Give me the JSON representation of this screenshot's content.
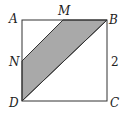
{
  "diagram": {
    "type": "geometry",
    "shape": "square ABCD with shaded quadrilateral MBDN",
    "points": {
      "A": {
        "label": "A",
        "x": 22,
        "y": 20
      },
      "B": {
        "label": "B",
        "x": 107,
        "y": 20
      },
      "C": {
        "label": "C",
        "x": 107,
        "y": 101
      },
      "D": {
        "label": "D",
        "x": 22,
        "y": 101
      },
      "M": {
        "label": "M",
        "x": 63,
        "y": 20
      },
      "N": {
        "label": "N",
        "x": 22,
        "y": 61
      }
    },
    "side_label": "2",
    "shaded_region": [
      "M",
      "B",
      "D",
      "N"
    ],
    "colors": {
      "stroke": "#333333",
      "fill": "#a9a9a9",
      "background": "#ffffff"
    }
  }
}
